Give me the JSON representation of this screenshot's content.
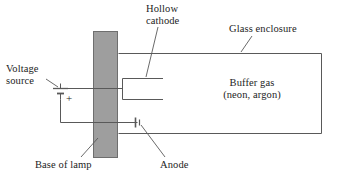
{
  "diagram": {
    "labels": {
      "hollow_cathode": "Hollow\ncathode",
      "hollow_cathode_line1": "Hollow",
      "hollow_cathode_line2": "cathode",
      "glass_enclosure": "Glass enclosure",
      "voltage_source_line1": "Voltage",
      "voltage_source_line2": "source",
      "buffer_gas_line1": "Buffer gas",
      "buffer_gas_line2": "(neon, argon)",
      "base_of_lamp": "Base of lamp",
      "anode": "Anode",
      "battery_polarity": "+"
    },
    "colors": {
      "background": "#ffffff",
      "stroke": "#595959",
      "text": "#1d1d1d",
      "lamp_base_fill": "#9e9e9e",
      "lamp_base_stroke": "#6e6e6e"
    },
    "parts": [
      {
        "name": "base-of-lamp",
        "shape": "filled-rectangle"
      },
      {
        "name": "glass-enclosure",
        "shape": "open-rectangle"
      },
      {
        "name": "hollow-cathode",
        "shape": "bracket"
      },
      {
        "name": "anode",
        "shape": "wire-with-bar"
      },
      {
        "name": "voltage-source",
        "shape": "battery-cell"
      }
    ]
  }
}
